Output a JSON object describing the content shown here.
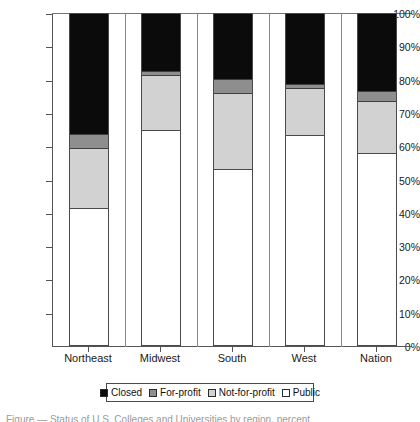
{
  "chart_data": {
    "type": "bar",
    "subtype": "stacked-100-percent",
    "title": "",
    "xlabel": "",
    "ylabel": "",
    "ylim": [
      0,
      100
    ],
    "ytick_labels": [
      "0%",
      "10%",
      "20%",
      "30%",
      "40%",
      "50%",
      "60%",
      "70%",
      "80%",
      "90%",
      "100%"
    ],
    "ytick_values": [
      0,
      10,
      20,
      30,
      40,
      50,
      60,
      70,
      80,
      90,
      100
    ],
    "grid": false,
    "legend_position": "bottom",
    "categories": [
      "Northeast",
      "Midwest",
      "South",
      "West",
      "Nation"
    ],
    "series": [
      {
        "name": "Public",
        "color": "#ffffff",
        "values": [
          41.5,
          65.0,
          53.0,
          63.5,
          58.0
        ]
      },
      {
        "name": "Not-for-profit",
        "color": "#d2d2d2",
        "values": [
          18.0,
          16.5,
          23.0,
          14.0,
          15.5
        ]
      },
      {
        "name": "For-profit",
        "color": "#8e8e8e",
        "values": [
          4.5,
          1.5,
          4.5,
          1.5,
          3.5
        ]
      },
      {
        "name": "Closed",
        "color": "#0b0b0b",
        "values": [
          36.0,
          17.0,
          19.5,
          21.0,
          23.0
        ]
      }
    ],
    "cumulative_tops": {
      "Northeast": {
        "public": 41.5,
        "not_for_profit": 59.5,
        "for_profit": 64.0,
        "closed": 100
      },
      "Midwest": {
        "public": 65.0,
        "not_for_profit": 81.5,
        "for_profit": 83.0,
        "closed": 100
      },
      "South": {
        "public": 53.0,
        "not_for_profit": 76.0,
        "for_profit": 80.5,
        "closed": 100
      },
      "West": {
        "public": 63.5,
        "not_for_profit": 77.5,
        "for_profit": 79.0,
        "closed": 100
      },
      "Nation": {
        "public": 58.0,
        "not_for_profit": 73.5,
        "for_profit": 77.0,
        "closed": 100
      }
    }
  },
  "legend": {
    "items": [
      {
        "label": "Closed",
        "key": "closed"
      },
      {
        "label": "For-profit",
        "key": "forprofit"
      },
      {
        "label": "Not-for-profit",
        "key": "notforprofit"
      },
      {
        "label": "Public",
        "key": "public"
      }
    ]
  },
  "axis": {
    "y": {
      "ticks": [
        {
          "label": "100%",
          "value": 100
        },
        {
          "label": "90%",
          "value": 90
        },
        {
          "label": "80%",
          "value": 80
        },
        {
          "label": "70%",
          "value": 70
        },
        {
          "label": "60%",
          "value": 60
        },
        {
          "label": "50%",
          "value": 50
        },
        {
          "label": "40%",
          "value": 40
        },
        {
          "label": "30%",
          "value": 30
        },
        {
          "label": "20%",
          "value": 20
        },
        {
          "label": "10%",
          "value": 10
        },
        {
          "label": "0%",
          "value": 0
        }
      ]
    },
    "x": {
      "ticks": [
        "Northeast",
        "Midwest",
        "South",
        "West",
        "Nation"
      ]
    }
  },
  "caption": {
    "text": "Figure — Status of U.S. Colleges and Universities by region, percent"
  }
}
